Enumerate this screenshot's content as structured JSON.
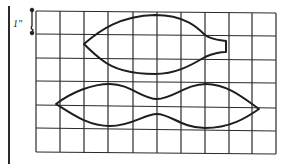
{
  "figure": {
    "scale_label": "1\"",
    "grid": {
      "x_lines": [
        36,
        60,
        84,
        108,
        133,
        157,
        181,
        205,
        229,
        252,
        276
      ],
      "y_lines": [
        11,
        34,
        58,
        81,
        105,
        128,
        153
      ],
      "columns": 10,
      "rows": 6,
      "square_size": "1 inch"
    },
    "shapes": [
      {
        "name": "upper-pattern-piece",
        "description": "Leaf/lens shape with squared tab at right end"
      },
      {
        "name": "lower-pattern-piece",
        "description": "Double-lobed shape pinched in the middle, pointed at both ends"
      }
    ],
    "colors": {
      "line": "#222222",
      "background": "#ffffff"
    }
  }
}
